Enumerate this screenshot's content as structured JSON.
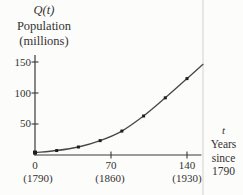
{
  "figure": {
    "y_axis": {
      "title_lines": [
        "Q(t)",
        "Population",
        "(millions)"
      ],
      "ticks_top_down": [
        "150",
        "100",
        "50"
      ]
    },
    "x_axis": {
      "ticks": [
        "0",
        "70",
        "140"
      ],
      "tick_year_sublabels": [
        "(1790)",
        "(1860)",
        "(1930)"
      ],
      "title_lines": [
        "t",
        "Years",
        "since",
        "1790"
      ]
    }
  },
  "colors": {
    "ink": "#3a3a3a",
    "curve": "#474747",
    "marker": "#1e1e1e",
    "page_rule": "#e7e7e4",
    "background": "#fcfcfa"
  },
  "chart_data": {
    "type": "line",
    "title": "",
    "xlabel": "t  Years since 1790",
    "ylabel": "Q(t)  Population (millions)",
    "x": [
      0,
      20,
      40,
      60,
      80,
      100,
      120,
      140
    ],
    "x_years": [
      1790,
      1810,
      1830,
      1850,
      1870,
      1890,
      1910,
      1930
    ],
    "values": [
      3.9,
      7.2,
      12.9,
      23.2,
      38.6,
      62.9,
      92.2,
      123.2
    ],
    "curve_extension_point": {
      "x": 155,
      "y": 147
    },
    "xticks": [
      0,
      70,
      140
    ],
    "xtick_year_labels": [
      "(1790)",
      "(1860)",
      "(1930)"
    ],
    "yticks": [
      50,
      100,
      150
    ],
    "xlim": [
      0,
      155
    ],
    "ylim": [
      0,
      160
    ],
    "grid": false,
    "marker": "square",
    "legend": "none"
  }
}
